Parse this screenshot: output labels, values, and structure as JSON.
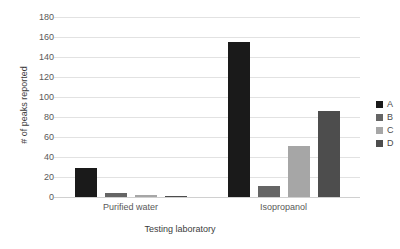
{
  "chart_data": {
    "type": "bar",
    "title": "",
    "xlabel": "Testing laboratory",
    "ylabel": "# of peaks reported",
    "categories": [
      "Purified water",
      "Isopropanol"
    ],
    "series": [
      {
        "name": "A",
        "values": [
          29,
          155
        ],
        "color": "#1a1a1a"
      },
      {
        "name": "B",
        "values": [
          4,
          11
        ],
        "color": "#656565"
      },
      {
        "name": "C",
        "values": [
          2,
          51
        ],
        "color": "#a6a6a6"
      },
      {
        "name": "D",
        "values": [
          1,
          86
        ],
        "color": "#4d4d4d"
      }
    ],
    "ylim": [
      0,
      180
    ],
    "yticks": [
      0,
      20,
      40,
      60,
      80,
      100,
      120,
      140,
      160,
      180
    ],
    "ytick_labels": [
      "0",
      "20",
      "40",
      "60",
      "80",
      "100",
      "120",
      "140",
      "160",
      "180"
    ],
    "grid": true,
    "legend_position": "right",
    "legend_entries": [
      "A",
      "B",
      "C",
      "D"
    ]
  }
}
